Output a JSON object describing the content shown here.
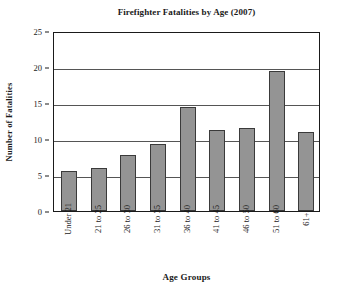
{
  "chart_data": {
    "type": "bar",
    "title": "Firefighter Fatalities by Age (2007)",
    "xlabel": "Age Groups",
    "ylabel": "Number of Fatalities",
    "categories": [
      "Under 21",
      "21 to 25",
      "26 to 30",
      "31 to 35",
      "36 to 40",
      "41 to 45",
      "46 to 50",
      "51 to 60",
      "61+"
    ],
    "values": [
      5.6,
      6.0,
      7.8,
      9.3,
      14.5,
      11.2,
      11.5,
      19.4,
      11.0
    ],
    "ylim": [
      0,
      25
    ],
    "yticks": [
      0,
      5,
      10,
      15,
      20,
      25
    ],
    "ytick_labels": [
      "0",
      "5",
      "10",
      "15",
      "20",
      "25"
    ],
    "grid": "horizontal",
    "legend": "none",
    "bar_color": "#949494",
    "bar_edge_color": "#3a3a3a",
    "axis_color": "#1a1a1a",
    "grid_color": "#555555",
    "background_color": "#ffffff"
  }
}
